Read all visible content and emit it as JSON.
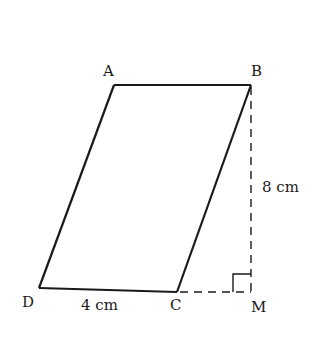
{
  "diagram": {
    "type": "parallelogram",
    "vertices": {
      "A": {
        "label": "A",
        "x": 114,
        "y": 85
      },
      "B": {
        "label": "B",
        "x": 251,
        "y": 85
      },
      "C": {
        "label": "C",
        "x": 177,
        "y": 292
      },
      "D": {
        "label": "D",
        "x": 39,
        "y": 288
      },
      "M": {
        "label": "M",
        "x": 251,
        "y": 292
      }
    },
    "labels": {
      "A": "A",
      "B": "B",
      "C": "C",
      "D": "D",
      "M": "M",
      "base": "4 cm",
      "height": "8 cm"
    },
    "colors": {
      "line": "#1a1a1a",
      "background": "#ffffff"
    }
  }
}
